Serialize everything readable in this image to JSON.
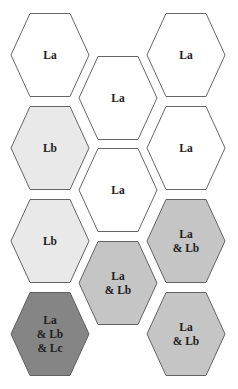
{
  "diagram": {
    "type": "hexagon-grid",
    "colors": {
      "La": "#ffffff",
      "Lb": "#e9e9e9",
      "La_Lb": "#c5c5c5",
      "La_Lb_Lc": "#858585",
      "stroke": "#555555"
    },
    "hexagons": [
      {
        "id": "hex-1",
        "cx": 50,
        "cy": 55,
        "fill": "#ffffff",
        "lines": [
          "La"
        ]
      },
      {
        "id": "hex-2",
        "cx": 186,
        "cy": 55,
        "fill": "#ffffff",
        "lines": [
          "La"
        ]
      },
      {
        "id": "hex-3",
        "cx": 118,
        "cy": 98,
        "fill": "#ffffff",
        "lines": [
          "La"
        ]
      },
      {
        "id": "hex-4",
        "cx": 50,
        "cy": 148,
        "fill": "#e9e9e9",
        "lines": [
          "Lb"
        ]
      },
      {
        "id": "hex-5",
        "cx": 186,
        "cy": 148,
        "fill": "#ffffff",
        "lines": [
          "La"
        ]
      },
      {
        "id": "hex-6",
        "cx": 118,
        "cy": 190,
        "fill": "#ffffff",
        "lines": [
          "La"
        ]
      },
      {
        "id": "hex-7",
        "cx": 50,
        "cy": 241,
        "fill": "#e9e9e9",
        "lines": [
          "Lb"
        ]
      },
      {
        "id": "hex-8",
        "cx": 186,
        "cy": 241,
        "fill": "#c5c5c5",
        "lines": [
          "La",
          "& Lb"
        ]
      },
      {
        "id": "hex-9",
        "cx": 118,
        "cy": 283,
        "fill": "#c5c5c5",
        "lines": [
          "La",
          "& Lb"
        ]
      },
      {
        "id": "hex-10",
        "cx": 50,
        "cy": 334,
        "fill": "#858585",
        "lines": [
          "La",
          "& Lb",
          "& Lc"
        ]
      },
      {
        "id": "hex-11",
        "cx": 186,
        "cy": 334,
        "fill": "#c5c5c5",
        "lines": [
          "La",
          "& Lb"
        ]
      }
    ]
  }
}
